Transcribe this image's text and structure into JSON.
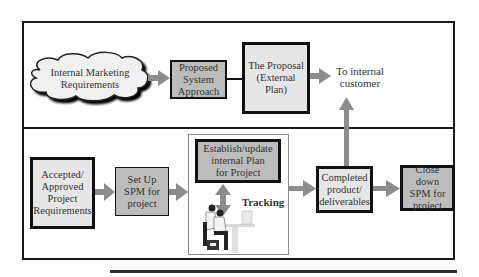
{
  "diagram": {
    "top_section": {
      "cloud": {
        "label_line1": "Internal Marketing",
        "label_line2": "Requirements"
      },
      "proposed_system_approach": {
        "line1": "Proposed",
        "line2": "System",
        "line3": "Approach"
      },
      "the_proposal": {
        "line1": "The Proposal",
        "line2": "(External Plan)"
      },
      "destination": {
        "line1": "To internal",
        "line2": "customer"
      }
    },
    "bottom_section": {
      "accepted_requirements": {
        "line1": "Accepted/",
        "line2": "Approved",
        "line3": "Project",
        "line4": "Requirements"
      },
      "set_up_spm": {
        "line1": "Set Up",
        "line2": "SPM for",
        "line3": "project"
      },
      "establish_plan": {
        "line1": "Establish/update",
        "line2": "internal Plan",
        "line3": "for Project"
      },
      "tracking_label": "Tracking",
      "completed": {
        "line1": "Completed",
        "line2": "product/",
        "line3": "deliverables"
      },
      "close_down": {
        "line1": "Close down",
        "line2": "SPM for",
        "line3": "project"
      }
    },
    "icons": {
      "workers_illustration": "people-at-computer-icon"
    },
    "colors": {
      "light_box": "#e6e6e6",
      "dark_box": "#bcbcbc",
      "arrow": "#8c8c8c",
      "border": "#111111"
    }
  }
}
